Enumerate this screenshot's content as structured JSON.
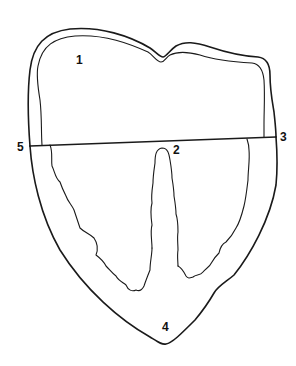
{
  "diagram": {
    "type": "anatomical-outline",
    "stroke_color": "#1a1a1a",
    "background": "#ffffff",
    "labels": [
      {
        "id": "1",
        "text": "1",
        "x": 76,
        "y": 54
      },
      {
        "id": "2",
        "text": "2",
        "x": 173,
        "y": 144
      },
      {
        "id": "3",
        "text": "3",
        "x": 280,
        "y": 131
      },
      {
        "id": "4",
        "text": "4",
        "x": 162,
        "y": 321
      },
      {
        "id": "5",
        "text": "5",
        "x": 17,
        "y": 141
      }
    ],
    "divider_line": {
      "x1": 30,
      "y1": 146,
      "x2": 276,
      "y2": 137
    }
  }
}
